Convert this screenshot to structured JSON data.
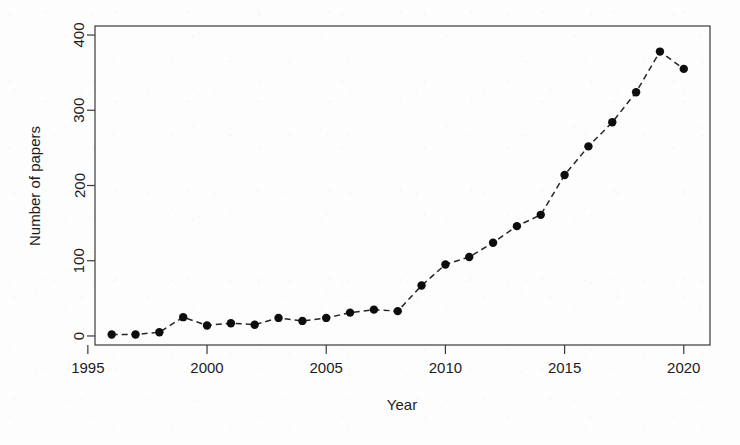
{
  "chart_data": {
    "type": "line",
    "title": "",
    "xlabel": "Year",
    "ylabel": "Number of papers",
    "grid": false,
    "legend": "none",
    "marker": "filled-circle",
    "linestyle": "dashed",
    "xlim": [
      1995.3,
      2021.1
    ],
    "ylim": [
      -12,
      412
    ],
    "xticks": [
      1995,
      2000,
      2005,
      2010,
      2015,
      2020
    ],
    "xtick_labels": [
      "1995",
      "2000",
      "2005",
      "2010",
      "2015",
      "2020"
    ],
    "yticks": [
      0,
      100,
      200,
      300,
      400
    ],
    "ytick_labels": [
      "0",
      "100",
      "200",
      "300",
      "400"
    ],
    "x": [
      1996,
      1997,
      1998,
      1999,
      2000,
      2001,
      2002,
      2003,
      2004,
      2005,
      2006,
      2007,
      2008,
      2009,
      2010,
      2011,
      2012,
      2013,
      2014,
      2015,
      2016,
      2017,
      2018,
      2019,
      2020
    ],
    "values": [
      2,
      2,
      5,
      25,
      14,
      17,
      15,
      24,
      20,
      24,
      31,
      35,
      33,
      67,
      95,
      105,
      124,
      146,
      161,
      214,
      252,
      284,
      324,
      378,
      355
    ],
    "series": [
      {
        "name": "Number of papers",
        "color": "#0d0d0d",
        "values": [
          2,
          2,
          5,
          25,
          14,
          17,
          15,
          24,
          20,
          24,
          31,
          35,
          33,
          67,
          95,
          105,
          124,
          146,
          161,
          214,
          252,
          284,
          324,
          378,
          355
        ]
      }
    ]
  },
  "figure": {
    "background_color": "#fdfdfd",
    "axis_color": "#3a3a3a",
    "point_color": "#0d0d0d"
  }
}
